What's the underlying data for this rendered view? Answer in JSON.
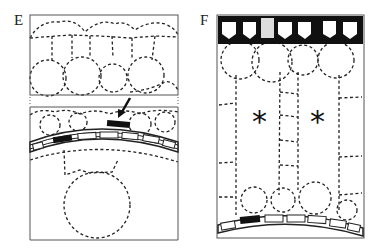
{
  "panels": [
    {
      "id": "E",
      "label": "E",
      "annotations": [
        "arrow"
      ]
    },
    {
      "id": "F",
      "label": "F",
      "annotations": [
        "asterisk",
        "asterisk"
      ]
    }
  ],
  "symbols": {
    "asterisk": "*"
  },
  "colors": {
    "line": "#222222",
    "fill_dark": "#111111",
    "frame": "#555555",
    "wall_light": "#dddddd"
  }
}
